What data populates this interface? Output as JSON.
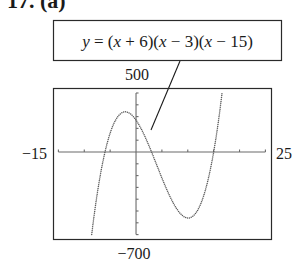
{
  "figure": {
    "problem_label": "17. (a)",
    "equation": "y = (x + 6)(x − 3)(x − 15)"
  },
  "window": {
    "xmin_label": "−15",
    "xmax_label": "25",
    "ymax_label": "500",
    "ymin_label": "−700"
  },
  "colors": {
    "curve": "#5a5a5a",
    "axis": "#6a6a6a",
    "frame": "#2a2a2a",
    "text": "#1a1a1a"
  },
  "chart_data": {
    "type": "line",
    "title": "17. (a)",
    "annotation": "y = (x + 6)(x − 3)(x − 15)",
    "function": "(x + 6)(x - 3)(x - 15)",
    "roots": [
      -6,
      3,
      15
    ],
    "xlabel": "",
    "ylabel": "",
    "xlim": [
      -15,
      25
    ],
    "ylim": [
      -700,
      500
    ],
    "xtick_step": 5,
    "ytick_step": 100,
    "grid": false,
    "legend": "none",
    "line_style": "dotted",
    "x": [
      -8,
      -7,
      -6,
      -5,
      -4,
      -3,
      -2,
      -1,
      0,
      1,
      2,
      3,
      4,
      5,
      6,
      7,
      8,
      9,
      10,
      11,
      12,
      13,
      14,
      15,
      16
    ],
    "series": [
      {
        "name": "y = (x + 6)(x − 3)(x − 15)",
        "values": [
          -506,
          -220,
          0,
          160,
          266,
          324,
          340,
          320,
          270,
          196,
          104,
          0,
          -110,
          -220,
          -324,
          -416,
          -490,
          -540,
          -560,
          -544,
          -486,
          -380,
          -220,
          0,
          286
        ]
      }
    ],
    "local_max": [
      -2.08,
      340
    ],
    "local_min": [
      10.08,
      -560
    ]
  }
}
